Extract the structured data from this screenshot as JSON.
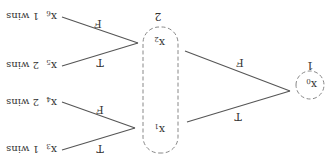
{
  "diagram": {
    "type": "game-tree",
    "orientation_note": "rendered rotated 180 degrees",
    "root": {
      "node": "x",
      "subscript": "0",
      "player": "1"
    },
    "info_set": {
      "player": "2",
      "nodes": [
        {
          "node": "x",
          "subscript": "1"
        },
        {
          "node": "x",
          "subscript": "2"
        }
      ]
    },
    "root_edges": [
      {
        "label": "T",
        "to": "x1"
      },
      {
        "label": "F",
        "to": "x2"
      }
    ],
    "x1_edges": [
      {
        "label": "T",
        "to": "x3"
      },
      {
        "label": "F",
        "to": "x4"
      }
    ],
    "x2_edges": [
      {
        "label": "T",
        "to": "x5"
      },
      {
        "label": "F",
        "to": "x6"
      }
    ],
    "leaves": [
      {
        "node": "x",
        "subscript": "3",
        "outcome": "1 wins"
      },
      {
        "node": "x",
        "subscript": "4",
        "outcome": "2 wins"
      },
      {
        "node": "x",
        "subscript": "5",
        "outcome": "2 wins"
      },
      {
        "node": "x",
        "subscript": "6",
        "outcome": "1 wins"
      }
    ]
  }
}
